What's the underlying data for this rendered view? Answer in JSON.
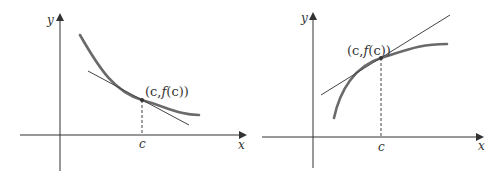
{
  "colors": {
    "axis": "#333333",
    "curve": "#6a6a6a",
    "tangent": "#444444",
    "background": "#ffffff"
  },
  "panels": [
    {
      "id": "left",
      "description": "Decreasing concave-up curve with tangent line at (c, f(c))",
      "x_axis_label": "x",
      "y_axis_label": "y",
      "tick_label": "c",
      "point_label": "(c,f(c))",
      "point_label_parts": [
        "(c,",
        "f",
        "(c))"
      ]
    },
    {
      "id": "right",
      "description": "Increasing concave-down curve with tangent line at (c, f(c))",
      "x_axis_label": "x",
      "y_axis_label": "y",
      "tick_label": "c",
      "point_label": "(c,f(c))",
      "point_label_parts": [
        "(c,",
        "f",
        "(c))"
      ]
    }
  ]
}
